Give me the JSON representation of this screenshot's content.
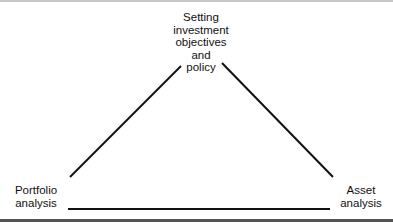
{
  "diagram": {
    "type": "triangle-process",
    "nodes": {
      "top": {
        "lines": [
          "Setting",
          "investment",
          "objectives",
          "and",
          "policy"
        ]
      },
      "bottom_left": {
        "lines": [
          "Portfolio",
          "analysis"
        ]
      },
      "bottom_right": {
        "lines": [
          "Asset",
          "analysis"
        ]
      }
    },
    "edges": [
      {
        "from": "top",
        "to": "bottom_left"
      },
      {
        "from": "top",
        "to": "bottom_right"
      },
      {
        "from": "bottom_left",
        "to": "bottom_right"
      }
    ],
    "colors": {
      "line": "#111111",
      "background": "#ffffff",
      "frame": "#555555"
    }
  }
}
